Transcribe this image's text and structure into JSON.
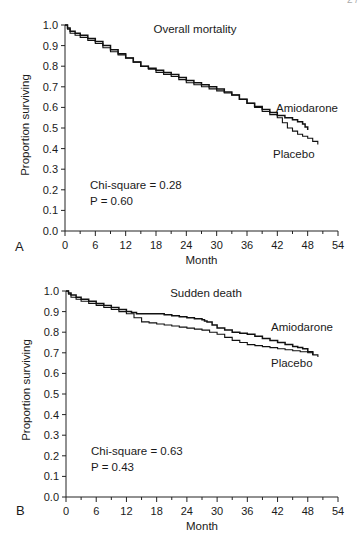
{
  "header": {
    "page_fragment": "2 /"
  },
  "chart_data": [
    {
      "type": "line",
      "panel_label": "A",
      "title": "Overall mortality",
      "xlabel": "Month",
      "ylabel": "Proportion surviving",
      "xlim": [
        0,
        54
      ],
      "ylim": [
        0.0,
        1.0
      ],
      "xticks": [
        0,
        6,
        12,
        18,
        24,
        30,
        36,
        42,
        48,
        54
      ],
      "yticks": [
        "0.0",
        "0.1",
        "0.2",
        "0.3",
        "0.4",
        "0.5",
        "0.6",
        "0.7",
        "0.8",
        "0.9",
        "1.0"
      ],
      "grid": false,
      "annotation": {
        "line1": "Chi-square = 0.28",
        "line2": "P = 0.60"
      },
      "series": [
        {
          "name": "Amiodarone",
          "x": [
            0,
            1,
            3,
            6,
            9,
            12,
            15,
            18,
            21,
            24,
            27,
            30,
            33,
            36,
            39,
            42,
            45,
            47,
            48
          ],
          "y": [
            1.0,
            0.97,
            0.95,
            0.92,
            0.88,
            0.84,
            0.8,
            0.78,
            0.76,
            0.73,
            0.71,
            0.69,
            0.66,
            0.62,
            0.59,
            0.56,
            0.54,
            0.52,
            0.49
          ]
        },
        {
          "name": "Placebo",
          "x": [
            0,
            1,
            3,
            6,
            9,
            12,
            15,
            18,
            21,
            24,
            27,
            30,
            33,
            36,
            39,
            42,
            44,
            46,
            48,
            50
          ],
          "y": [
            1.0,
            0.96,
            0.94,
            0.91,
            0.87,
            0.84,
            0.8,
            0.77,
            0.75,
            0.72,
            0.7,
            0.68,
            0.66,
            0.62,
            0.58,
            0.55,
            0.5,
            0.47,
            0.45,
            0.42
          ]
        }
      ],
      "legend_labels": {
        "amiodarone": "Amiodarone",
        "placebo": "Placebo"
      }
    },
    {
      "type": "line",
      "panel_label": "B",
      "title": "Sudden death",
      "xlabel": "Month",
      "ylabel": "Proportion surviving",
      "xlim": [
        0,
        54
      ],
      "ylim": [
        0.0,
        1.0
      ],
      "xticks": [
        0,
        6,
        12,
        18,
        24,
        30,
        36,
        42,
        48,
        54
      ],
      "yticks": [
        "0.0",
        "0.1",
        "0.2",
        "0.3",
        "0.4",
        "0.5",
        "0.6",
        "0.7",
        "0.8",
        "0.9",
        "1.0"
      ],
      "grid": false,
      "annotation": {
        "line1": "Chi-square = 0.63",
        "line2": "P = 0.43"
      },
      "series": [
        {
          "name": "Amiodarone",
          "x": [
            0,
            1,
            3,
            6,
            9,
            12,
            14,
            18,
            21,
            24,
            27,
            28,
            30,
            33,
            36,
            39,
            42,
            45,
            47,
            49
          ],
          "y": [
            1.0,
            0.98,
            0.96,
            0.94,
            0.92,
            0.9,
            0.89,
            0.89,
            0.88,
            0.87,
            0.86,
            0.85,
            0.82,
            0.8,
            0.79,
            0.77,
            0.75,
            0.73,
            0.72,
            0.69
          ]
        },
        {
          "name": "Placebo",
          "x": [
            0,
            1,
            3,
            6,
            9,
            12,
            15,
            18,
            21,
            24,
            27,
            30,
            33,
            36,
            39,
            42,
            45,
            48,
            50
          ],
          "y": [
            1.0,
            0.97,
            0.95,
            0.93,
            0.91,
            0.89,
            0.85,
            0.84,
            0.83,
            0.82,
            0.81,
            0.79,
            0.76,
            0.74,
            0.73,
            0.72,
            0.71,
            0.7,
            0.68
          ]
        }
      ],
      "legend_labels": {
        "amiodarone": "Amiodarone",
        "placebo": "Placebo"
      }
    }
  ]
}
